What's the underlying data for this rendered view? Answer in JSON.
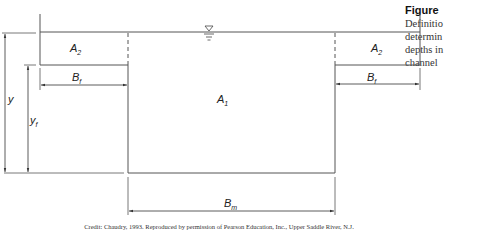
{
  "caption": {
    "title": "Figure",
    "lines": [
      "Definitio",
      "determin",
      "depths in",
      "channel"
    ]
  },
  "diagram": {
    "labels": {
      "A2_left": "A",
      "A2_left_sub": "2",
      "A2_right": "A",
      "A2_right_sub": "2",
      "A1": "A",
      "A1_sub": "1",
      "Bf_left": "B",
      "Bf_left_sub": "f",
      "Bf_right": "B",
      "Bf_right_sub": "f",
      "Bm": "B",
      "Bm_sub": "m",
      "y": "y",
      "yf": "y",
      "yf_sub": "f"
    },
    "water_surface_symbol": "water-surface-triangle",
    "line_color": "#555555"
  },
  "credit": "Credit: Chaudry, 1993. Reproduced by permission of Pearson Education, Inc., Upper Saddle River, N.J."
}
